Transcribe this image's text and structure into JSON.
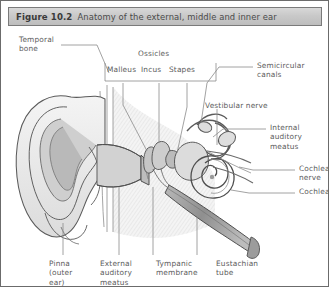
{
  "figure": {
    "number": "Figure 10.2",
    "caption": "Anatomy of the external, middle and inner ear"
  },
  "labels": {
    "temporal_bone": "Temporal\nbone",
    "ossicles_group": "Ossicles",
    "malleus": "Malleus",
    "incus": "Incus",
    "stapes": "Stapes",
    "semicircular_canals": "Semicircular\ncanals",
    "vestibular_nerve": "Vestibular nerve",
    "internal_auditory_meatus": "Internal\nauditory\nmeatus",
    "cochlea_nerve": "Cochlea\nnerve",
    "cochlea": "Cochlea",
    "pinna": "Pinna\n(outer\near)",
    "external_auditory_meatus": "External\nauditory\nmeatus",
    "tympanic_membrane": "Tympanic\nmembrane",
    "eustachian_tube": "Eustachian\ntube"
  },
  "colors": {
    "page_border": "#6b6b6b",
    "title_bar_border": "#7a7a7a",
    "title_text": "#3a3a3a",
    "label_text": "#5c5c5c",
    "leader_line": "#8a8a8a",
    "ink": "#4f4f4f",
    "shade_light": "#efefef",
    "shade_mid": "#cfcfcf",
    "shade_dark": "#a9a9a9"
  }
}
